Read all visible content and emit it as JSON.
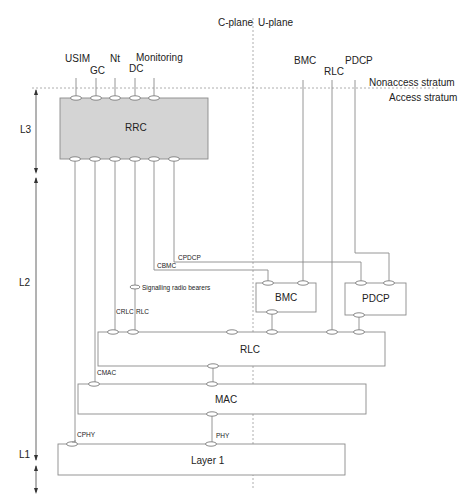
{
  "planes": {
    "control": "C-plane",
    "user": "U-plane"
  },
  "strata": {
    "upper": "Nonaccess stratum",
    "lower": "Access stratum"
  },
  "layers": {
    "l3": "L3",
    "l2": "L2",
    "l1": "L1"
  },
  "upper_saps": {
    "usim": "USIM",
    "gc": "GC",
    "nt": "Nt",
    "dc": "DC",
    "monitoring": "Monitoring",
    "bmc": "BMC",
    "rlc": "RLC",
    "pdcp": "PDCP"
  },
  "blocks": {
    "rrc": "RRC",
    "bmc": "BMC",
    "pdcp": "PDCP",
    "rlc": "RLC",
    "mac": "MAC",
    "layer1": "Layer 1"
  },
  "control_links": {
    "cpdcp": "CPDCP",
    "cbmc": "CBMC",
    "crlc": "CRLC",
    "rlc": "RLC",
    "cmac": "CMAC",
    "cphy": "CPHY",
    "phy": "PHY"
  },
  "legend": {
    "signalling_radio_bearers": "Signalling radio bearers"
  },
  "colors": {
    "rrc_fill": "#d4d4d4",
    "line": "#8a8a8a",
    "text": "#222222"
  }
}
